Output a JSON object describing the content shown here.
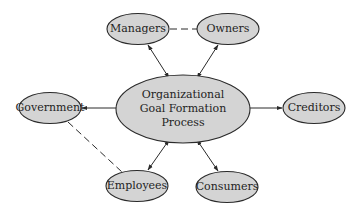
{
  "diagram": {
    "center": {
      "lines": [
        "Organizational",
        "Goal Formation",
        "Process"
      ]
    },
    "nodes": {
      "managers": "Managers",
      "owners": "Owners",
      "government": "Government",
      "creditors": "Creditors",
      "employees": "Employees",
      "consumers": "Consumers"
    },
    "edges": [
      {
        "from": "managers",
        "to": "center",
        "style": "solid",
        "arrows": "both"
      },
      {
        "from": "owners",
        "to": "center",
        "style": "solid",
        "arrows": "both"
      },
      {
        "from": "government",
        "to": "center",
        "style": "solid",
        "arrows": "both"
      },
      {
        "from": "creditors",
        "to": "center",
        "style": "solid",
        "arrows": "both"
      },
      {
        "from": "employees",
        "to": "center",
        "style": "solid",
        "arrows": "both"
      },
      {
        "from": "consumers",
        "to": "center",
        "style": "solid",
        "arrows": "both"
      },
      {
        "from": "managers",
        "to": "owners",
        "style": "dashed",
        "arrows": "none"
      },
      {
        "from": "government",
        "to": "employees",
        "style": "dashed",
        "arrows": "none"
      }
    ],
    "colors": {
      "node_fill": "#d4d4d4",
      "stroke": "#2a2a2a",
      "background": "#ffffff"
    }
  }
}
